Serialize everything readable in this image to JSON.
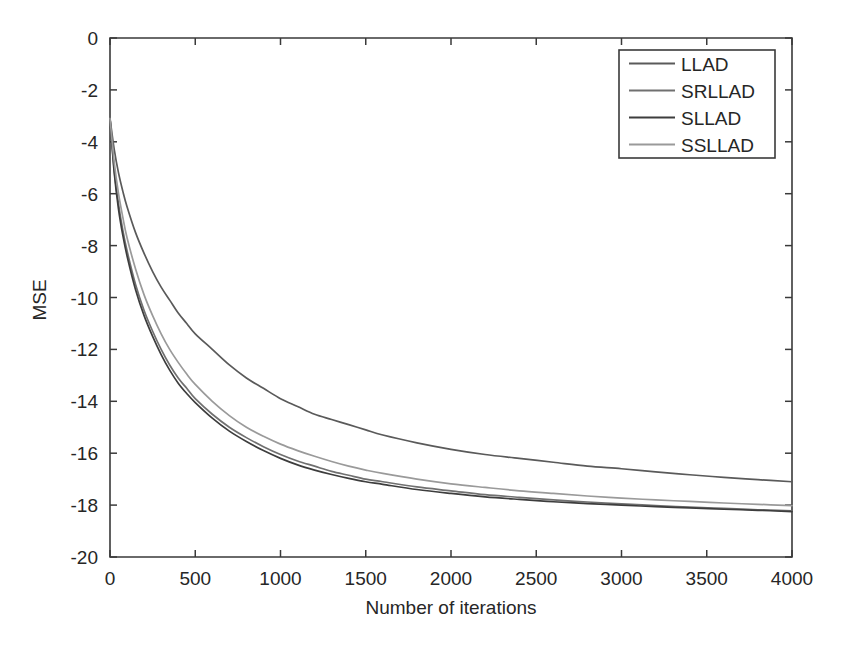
{
  "chart_data": {
    "type": "line",
    "title": "",
    "xlabel": "Number of iterations",
    "ylabel": "MSE",
    "xlim": [
      0,
      4000
    ],
    "ylim": [
      -20,
      0
    ],
    "grid": false,
    "legend_position": "top-right",
    "xticks": [
      0,
      500,
      1000,
      1500,
      2000,
      2500,
      3000,
      3500,
      4000
    ],
    "xtick_labels": [
      "0",
      "500",
      "1000",
      "1500",
      "2000",
      "2500",
      "3000",
      "3500",
      "4000"
    ],
    "yticks": [
      0,
      -2,
      -4,
      -6,
      -8,
      -10,
      -12,
      -14,
      -16,
      -18,
      -20
    ],
    "ytick_labels": [
      "0",
      "-2",
      "-4",
      "-6",
      "-8",
      "-10",
      "-12",
      "-14",
      "-16",
      "-18",
      "-20"
    ],
    "x": [
      0,
      25,
      50,
      75,
      100,
      150,
      200,
      250,
      300,
      350,
      400,
      450,
      500,
      600,
      700,
      800,
      900,
      1000,
      1100,
      1200,
      1300,
      1400,
      1500,
      1600,
      1800,
      2000,
      2200,
      2400,
      2600,
      2800,
      3000,
      3200,
      3400,
      3600,
      3800,
      4000
    ],
    "series": [
      {
        "name": "LLAD",
        "color": "#5a5a5a",
        "values": [
          -3.1,
          -4.3,
          -5.2,
          -5.9,
          -6.5,
          -7.5,
          -8.3,
          -9.0,
          -9.6,
          -10.1,
          -10.6,
          -11.0,
          -11.4,
          -12.0,
          -12.6,
          -13.1,
          -13.5,
          -13.9,
          -14.2,
          -14.5,
          -14.7,
          -14.9,
          -15.1,
          -15.3,
          -15.6,
          -15.85,
          -16.05,
          -16.2,
          -16.35,
          -16.5,
          -16.6,
          -16.72,
          -16.83,
          -16.93,
          -17.02,
          -17.1
        ]
      },
      {
        "name": "SRLLAD",
        "color": "#707070",
        "values": [
          -3.1,
          -5.1,
          -6.4,
          -7.4,
          -8.2,
          -9.5,
          -10.5,
          -11.3,
          -12.0,
          -12.6,
          -13.1,
          -13.5,
          -13.9,
          -14.5,
          -15.0,
          -15.4,
          -15.75,
          -16.05,
          -16.3,
          -16.5,
          -16.7,
          -16.85,
          -17.0,
          -17.1,
          -17.3,
          -17.45,
          -17.6,
          -17.7,
          -17.8,
          -17.88,
          -17.95,
          -18.02,
          -18.08,
          -18.13,
          -18.18,
          -18.22
        ]
      },
      {
        "name": "SLLAD",
        "color": "#3d3d3d",
        "values": [
          -3.1,
          -5.2,
          -6.6,
          -7.6,
          -8.4,
          -9.7,
          -10.7,
          -11.5,
          -12.2,
          -12.8,
          -13.3,
          -13.7,
          -14.05,
          -14.65,
          -15.15,
          -15.55,
          -15.9,
          -16.2,
          -16.45,
          -16.65,
          -16.82,
          -16.97,
          -17.1,
          -17.2,
          -17.4,
          -17.55,
          -17.68,
          -17.78,
          -17.87,
          -17.94,
          -18.0,
          -18.06,
          -18.11,
          -18.16,
          -18.2,
          -18.25
        ]
      },
      {
        "name": "SSLLAD",
        "color": "#9a9a9a",
        "values": [
          -3.1,
          -4.8,
          -6.0,
          -6.9,
          -7.7,
          -8.9,
          -9.9,
          -10.7,
          -11.4,
          -12.0,
          -12.5,
          -12.95,
          -13.35,
          -14.0,
          -14.55,
          -15.0,
          -15.35,
          -15.65,
          -15.9,
          -16.12,
          -16.32,
          -16.5,
          -16.65,
          -16.78,
          -17.0,
          -17.18,
          -17.32,
          -17.45,
          -17.55,
          -17.65,
          -17.73,
          -17.8,
          -17.86,
          -17.92,
          -17.97,
          -18.02
        ]
      }
    ]
  },
  "legend": {
    "items": [
      {
        "label": "LLAD"
      },
      {
        "label": "SRLLAD"
      },
      {
        "label": "SLLAD"
      },
      {
        "label": "SSLLAD"
      }
    ]
  }
}
